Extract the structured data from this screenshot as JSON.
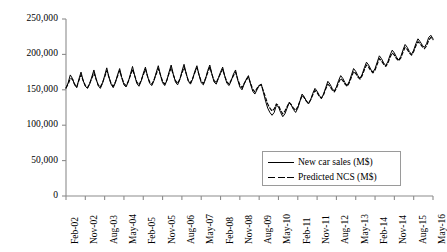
{
  "chart_data": {
    "type": "line",
    "title": "",
    "xlabel": "",
    "ylabel": "",
    "ylim": [
      0,
      250000
    ],
    "ytick_values": [
      0,
      50000,
      100000,
      150000,
      200000,
      250000
    ],
    "ytick_labels": [
      "0",
      "50,000",
      "100,000",
      "150,000",
      "200,000",
      "250,000"
    ],
    "grid": false,
    "legend_position": "lower-right-inside",
    "x_tick_labels": [
      "Feb-02",
      "Nov-02",
      "Aug-03",
      "May-04",
      "Feb-05",
      "Nov-05",
      "Aug-06",
      "May-07",
      "Feb-08",
      "Nov-08",
      "Aug-09",
      "May-10",
      "Feb-11",
      "Nov-11",
      "Aug-12",
      "May-13",
      "Feb-14",
      "Nov-14",
      "Aug-15",
      "May-16"
    ],
    "x_tick_interval_months": 9,
    "x_start_label": "Feb-02",
    "x_end_label": "May-16",
    "series": [
      {
        "name": "New car sales (M$)",
        "style": "solid",
        "color": "#000000",
        "values": [
          152000,
          160000,
          171000,
          166000,
          157000,
          153000,
          165000,
          175000,
          163000,
          155000,
          152000,
          158000,
          168000,
          178000,
          166000,
          156000,
          152000,
          159000,
          170000,
          181000,
          168000,
          158000,
          153000,
          160000,
          171000,
          180000,
          167000,
          157000,
          154000,
          161000,
          172000,
          183000,
          170000,
          159000,
          155000,
          162000,
          173000,
          182000,
          169000,
          159000,
          156000,
          163000,
          174000,
          184000,
          171000,
          160000,
          156000,
          163000,
          175000,
          185000,
          172000,
          161000,
          157000,
          164000,
          176000,
          186000,
          173000,
          162000,
          158000,
          165000,
          176000,
          184000,
          171000,
          160000,
          157000,
          165000,
          177000,
          185000,
          172000,
          161000,
          158000,
          166000,
          175000,
          182000,
          169000,
          159000,
          156000,
          163000,
          172000,
          178000,
          164000,
          154000,
          150000,
          158000,
          165000,
          170000,
          158000,
          148000,
          144000,
          150000,
          156000,
          158000,
          146000,
          134000,
          124000,
          118000,
          114000,
          118000,
          128000,
          126000,
          118000,
          112000,
          116000,
          124000,
          132000,
          128000,
          122000,
          118000,
          124000,
          134000,
          144000,
          140000,
          134000,
          130000,
          136000,
          145000,
          152000,
          148000,
          142000,
          138000,
          144000,
          153000,
          162000,
          158000,
          152000,
          148000,
          154000,
          163000,
          170000,
          166000,
          160000,
          156000,
          162000,
          171000,
          180000,
          176000,
          170000,
          166000,
          172000,
          181000,
          189000,
          185000,
          179000,
          175000,
          180000,
          189000,
          198000,
          194000,
          188000,
          184000,
          190000,
          199000,
          206000,
          202000,
          196000,
          192000,
          197000,
          206000,
          214000,
          210000,
          204000,
          200000,
          206000,
          215000,
          222000,
          218000,
          213000,
          210000,
          215000,
          224000,
          227000,
          222000
        ]
      },
      {
        "name": "Predicted NCS (M$)",
        "style": "dashed",
        "color": "#000000",
        "values": [
          153000,
          158000,
          166000,
          165000,
          158000,
          154000,
          163000,
          171000,
          163000,
          156000,
          153000,
          159000,
          166000,
          174000,
          165000,
          157000,
          154000,
          160000,
          168000,
          177000,
          168000,
          159000,
          155000,
          161000,
          169000,
          177000,
          167000,
          159000,
          156000,
          162000,
          170000,
          179000,
          170000,
          161000,
          157000,
          163000,
          171000,
          179000,
          169000,
          161000,
          158000,
          164000,
          172000,
          180000,
          171000,
          162000,
          158000,
          164000,
          173000,
          181000,
          171000,
          163000,
          159000,
          165000,
          173000,
          182000,
          173000,
          163000,
          160000,
          166000,
          174000,
          181000,
          171000,
          162000,
          159000,
          166000,
          174000,
          182000,
          172000,
          163000,
          160000,
          167000,
          173000,
          179000,
          169000,
          161000,
          158000,
          164000,
          170000,
          175000,
          165000,
          157000,
          153000,
          159000,
          164000,
          168000,
          159000,
          151000,
          147000,
          152000,
          156000,
          157000,
          148000,
          139000,
          130000,
          124000,
          120000,
          123000,
          130000,
          128000,
          121000,
          116000,
          120000,
          126000,
          132000,
          129000,
          124000,
          121000,
          126000,
          134000,
          142000,
          139000,
          134000,
          131000,
          136000,
          143000,
          149000,
          146000,
          141000,
          138000,
          143000,
          151000,
          158000,
          155000,
          150000,
          147000,
          152000,
          160000,
          166000,
          163000,
          158000,
          155000,
          160000,
          168000,
          176000,
          173000,
          168000,
          165000,
          170000,
          178000,
          185000,
          182000,
          177000,
          174000,
          178000,
          186000,
          194000,
          191000,
          186000,
          183000,
          188000,
          196000,
          202000,
          199000,
          194000,
          191000,
          195000,
          203000,
          210000,
          207000,
          202000,
          199000,
          204000,
          212000,
          218000,
          215000,
          211000,
          208000,
          212000,
          220000,
          224000,
          221000
        ]
      }
    ]
  },
  "legend": {
    "items": [
      {
        "label": "New car sales (M$)",
        "style": "solid"
      },
      {
        "label": "Predicted NCS (M$)",
        "style": "dashed"
      }
    ]
  }
}
